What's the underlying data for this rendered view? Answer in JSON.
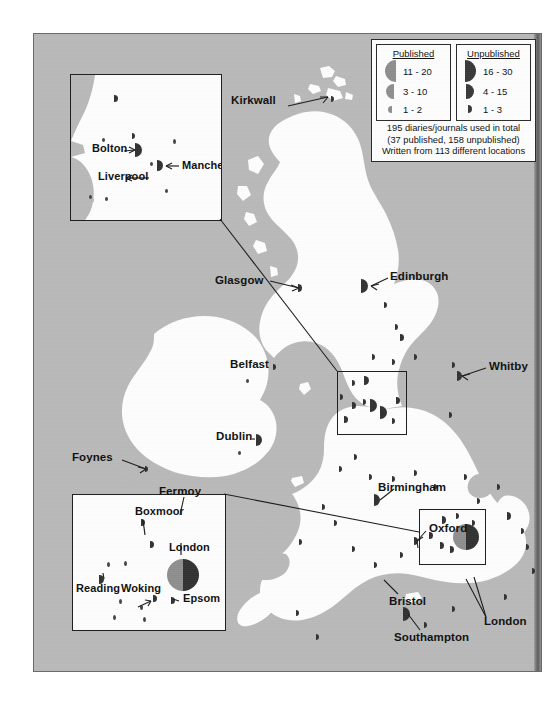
{
  "figure": {
    "type": "thematic-dot-map",
    "region": "British Isles",
    "background_color": "#b9b9b9",
    "land_color": "#fdfdfd"
  },
  "legend": {
    "published": {
      "title": "Published",
      "symbol_side": "left",
      "color": "#8f8f8f",
      "classes": [
        {
          "label": "11 - 20",
          "size": 22
        },
        {
          "label": "3 - 10",
          "size": 15
        },
        {
          "label": "1 - 2",
          "size": 7
        }
      ]
    },
    "unpublished": {
      "title": "Unpublished",
      "symbol_side": "right",
      "color": "#3a3a3a",
      "classes": [
        {
          "label": "16 - 30",
          "size": 22
        },
        {
          "label": "4 - 15",
          "size": 15
        },
        {
          "label": "1 - 3",
          "size": 8
        }
      ]
    },
    "note": {
      "line1": "195 diaries/journals used in total",
      "line2": "(37 published, 158 unpublished)",
      "line3": "Written from 113 different locations"
    },
    "totals": {
      "total_diaries": 195,
      "published": 37,
      "unpublished": 158,
      "locations": 113
    }
  },
  "main_labels": [
    {
      "name": "Kirkwall",
      "text": "Kirkwall",
      "x": 239,
      "y": 67,
      "align": "right"
    },
    {
      "name": "Glasgow",
      "text": "Glasgow",
      "x": 192,
      "y": 244,
      "align": "right"
    },
    {
      "name": "Edinburgh",
      "text": "Edinburgh",
      "x": 357,
      "y": 240,
      "align": "left"
    },
    {
      "name": "Belfast",
      "text": "Belfast",
      "x": 194,
      "y": 331,
      "align": "left"
    },
    {
      "name": "Whitby",
      "text": "Whitby",
      "x": 456,
      "y": 330,
      "align": "left"
    },
    {
      "name": "Dublin",
      "text": "Dublin",
      "x": 183,
      "y": 402,
      "align": "left"
    },
    {
      "name": "Foynes",
      "text": "Foynes",
      "x": 61,
      "y": 421,
      "align": "left"
    },
    {
      "name": "Fermoy",
      "text": "Fermoy",
      "x": 127,
      "y": 456,
      "align": "left"
    },
    {
      "name": "Birmingham",
      "text": "Birmingham",
      "x": 345,
      "y": 450,
      "align": "left"
    },
    {
      "name": "Oxford",
      "text": "Oxford",
      "x": 396,
      "y": 491,
      "align": "left"
    },
    {
      "name": "Bristol",
      "text": "Bristol",
      "x": 357,
      "y": 565,
      "align": "left"
    },
    {
      "name": "London",
      "text": "London",
      "x": 450,
      "y": 586,
      "align": "left"
    },
    {
      "name": "Southampton",
      "text": "Southampton",
      "x": 363,
      "y": 601,
      "align": "left"
    },
    {
      "name": "Guernsey",
      "text": "Guernsey",
      "x": 287,
      "y": 659,
      "align": "left"
    }
  ],
  "insets": [
    {
      "name": "manchester-inset",
      "id": "inset-north",
      "labels": [
        {
          "text": "Bolton",
          "x": 21,
          "y": 98
        },
        {
          "text": "Liverpool",
          "x": 27,
          "y": 122
        },
        {
          "text": "Manchester",
          "x": 111,
          "y": 113
        }
      ]
    },
    {
      "name": "london-inset",
      "id": "inset-south",
      "labels": [
        {
          "text": "Boxmoor",
          "x": 62,
          "y": 33
        },
        {
          "text": "London",
          "x": 104,
          "y": 63
        },
        {
          "text": "Reading",
          "x": 3,
          "y": 105
        },
        {
          "text": "Woking",
          "x": 48,
          "y": 105
        },
        {
          "text": "Epsom",
          "x": 108,
          "y": 112
        }
      ]
    }
  ]
}
